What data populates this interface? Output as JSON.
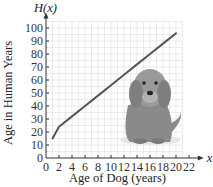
{
  "chart_data": {
    "type": "line",
    "title": "",
    "xlabel": "Age of Dog (years)",
    "ylabel": "Age in Human Years",
    "x_axis_symbol": "x",
    "y_axis_symbol": "H(x)",
    "xlim": [
      0,
      22
    ],
    "ylim": [
      0,
      100
    ],
    "x_ticks": [
      0,
      2,
      4,
      6,
      8,
      10,
      12,
      14,
      16,
      18,
      20,
      22
    ],
    "y_ticks": [
      0,
      10,
      20,
      30,
      40,
      50,
      60,
      70,
      80,
      90,
      100
    ],
    "grid": true,
    "legend": null,
    "series": [
      {
        "name": "H(x)",
        "x": [
          1,
          2,
          4,
          6,
          8,
          10,
          12,
          14,
          16,
          18,
          20
        ],
        "y": [
          15,
          24,
          32,
          40,
          48,
          56,
          64,
          72,
          80,
          88,
          96
        ]
      }
    ],
    "annotation": "illustration of a sitting puppy"
  }
}
